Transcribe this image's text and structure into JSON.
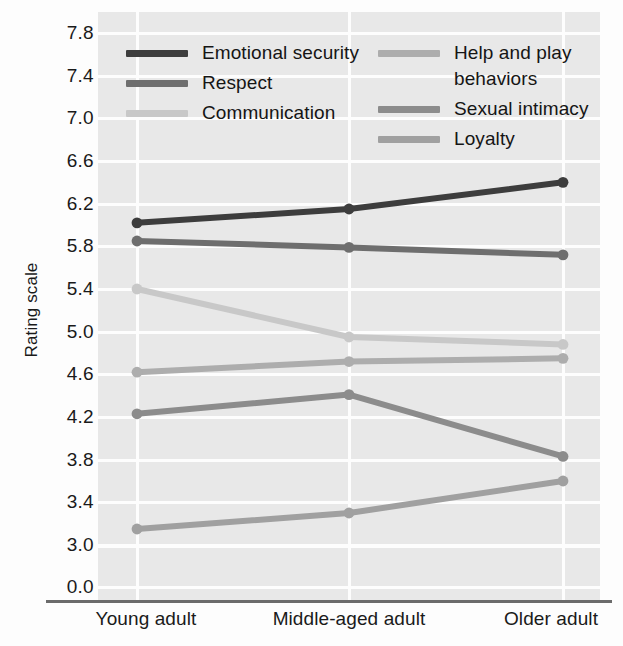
{
  "chart_data": {
    "type": "line",
    "title": "",
    "xlabel": "",
    "ylabel": "Rating scale",
    "categories": [
      "Young adult",
      "Middle-aged adult",
      "Older adult"
    ],
    "ylim": [
      3.0,
      7.8
    ],
    "yticks": [
      "7.8",
      "7.4",
      "7.0",
      "6.6",
      "6.2",
      "5.8",
      "5.4",
      "5.0",
      "4.6",
      "4.2",
      "3.8",
      "3.4",
      "3.0",
      "0.0"
    ],
    "ytick_values": [
      7.8,
      7.4,
      7.0,
      6.6,
      6.2,
      5.8,
      5.4,
      5.0,
      4.6,
      4.2,
      3.8,
      3.4,
      3.0,
      0.0
    ],
    "axis_broken_between": [
      3.0,
      0.0
    ],
    "grid": true,
    "legend_position": "top-inside",
    "plot_background": "#e8e8e8",
    "gridline_color": "#fdfdfd",
    "series": [
      {
        "name": "Emotional security",
        "values": [
          6.02,
          6.15,
          6.4
        ],
        "color": "#3d3d3d"
      },
      {
        "name": "Respect",
        "values": [
          5.85,
          5.79,
          5.72
        ],
        "color": "#6e6e6e"
      },
      {
        "name": "Communication",
        "values": [
          5.4,
          4.95,
          4.88
        ],
        "color": "#c8c8c8"
      },
      {
        "name": "Help and play behaviors",
        "values": [
          4.62,
          4.72,
          4.75
        ],
        "color": "#adadad"
      },
      {
        "name": "Sexual intimacy",
        "values": [
          4.23,
          4.41,
          3.83
        ],
        "color": "#8c8c8c"
      },
      {
        "name": "Loyalty",
        "values": [
          3.15,
          3.3,
          3.6
        ],
        "color": "#a0a0a0"
      }
    ]
  },
  "legend": {
    "left_column": [
      {
        "label": "Emotional security",
        "color": "#3d3d3d"
      },
      {
        "label": "Respect",
        "color": "#6e6e6e"
      },
      {
        "label": "Communication",
        "color": "#c8c8c8"
      }
    ],
    "right_column": [
      {
        "label": "Help and play behaviors",
        "color": "#adadad"
      },
      {
        "label": "Sexual intimacy",
        "color": "#8c8c8c"
      },
      {
        "label": "Loyalty",
        "color": "#a0a0a0"
      }
    ]
  }
}
